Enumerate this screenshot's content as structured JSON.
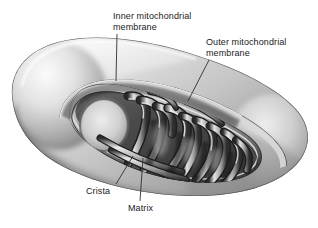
{
  "figure": {
    "style": "grayscale pencil airbrush cutaway illustration",
    "background_color": "#ffffff",
    "label_text_color": "#1a1a1a",
    "leader_line_color": "#303030",
    "width": 318,
    "height": 228
  },
  "labels": [
    {
      "id": "inner-mitochondrial-membrane",
      "line1": "Inner mitochondrial",
      "line2": "membrane",
      "text": "Inner mitochondrial membrane",
      "leader": {
        "x1": 117,
        "y1": 34,
        "x2": 116,
        "y2": 81
      }
    },
    {
      "id": "outer-mitochondrial-membrane",
      "line1": "Outer mitochondrial",
      "line2": "membrane",
      "text": "Outer mitochondrial membrane",
      "leader": {
        "x1": 209,
        "y1": 60,
        "x2": 188,
        "y2": 101
      }
    },
    {
      "id": "crista",
      "line1": "Crista",
      "line2": "",
      "text": "Crista",
      "leader": {
        "x1": 116,
        "y1": 184,
        "x2": 133,
        "y2": 156
      }
    },
    {
      "id": "matrix",
      "line1": "Matrix",
      "line2": "",
      "text": "Matrix",
      "leader": {
        "x1": 140,
        "y1": 201,
        "x2": 143,
        "y2": 158
      }
    }
  ],
  "palette": {
    "outer_surface_light": "#f2f2f2",
    "outer_surface_mid": "#c9c9c9",
    "outer_surface_shadow": "#7d7d7d",
    "rim_dark": "#4a4a4a",
    "interior_dark": "#3b3b3b",
    "crista_highlight": "#e8e8e8",
    "crista_shadow": "#2e2e2e",
    "matrix_light": "#dcdcdc"
  }
}
